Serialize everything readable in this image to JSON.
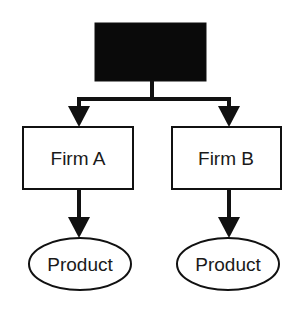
{
  "diagram": {
    "colors": {
      "stroke": "#111111",
      "top_fill": "#0a0a0a",
      "box_fill": "#ffffff",
      "text": "#1a1a1a"
    },
    "top_node": {
      "label": ""
    },
    "firms": [
      {
        "label": "Firm A",
        "product": "Product"
      },
      {
        "label": "Firm B",
        "product": "Product"
      }
    ]
  }
}
